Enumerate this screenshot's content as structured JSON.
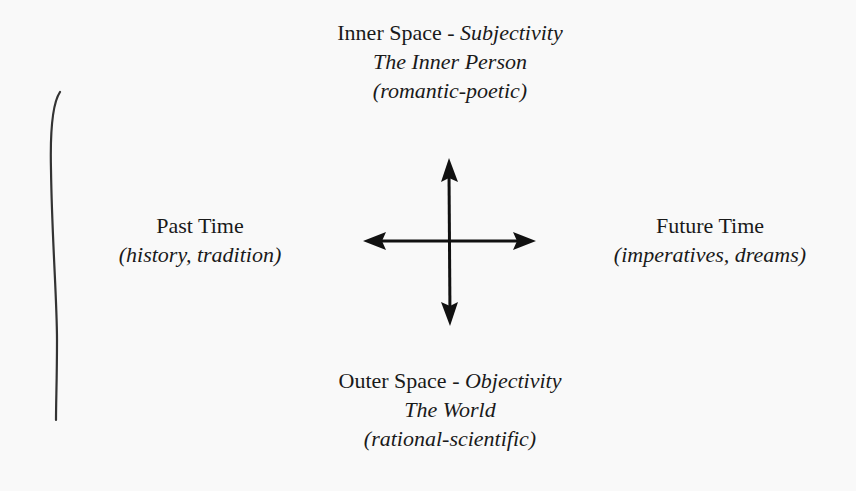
{
  "diagram": {
    "top": {
      "heading": "Inner Space - ",
      "heading_italic": "Subjectivity",
      "subtitle": "The Inner Person",
      "note": "(romantic-poetic)"
    },
    "bottom": {
      "heading": "Outer Space - ",
      "heading_italic": "Objectivity",
      "subtitle": "The World",
      "note": "(rational-scientific)"
    },
    "left": {
      "heading": "Past Time",
      "note": "(history, tradition)"
    },
    "right": {
      "heading": "Future Time",
      "note": "(imperatives, dreams)"
    },
    "arrows": {
      "type": "four-way-cross",
      "directions": [
        "up",
        "down",
        "left",
        "right"
      ],
      "color": "#111111"
    },
    "side_bracket": {
      "color": "#333333"
    }
  }
}
